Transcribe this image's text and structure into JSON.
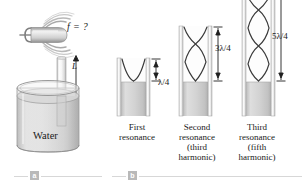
{
  "figure": {
    "panel_a": {
      "marker": "a",
      "frequency_label": "f = ?",
      "length_label": "L",
      "liquid_label": "Water",
      "fork_icon": "tuning-fork-icon",
      "sound_waves_icon": "sound-wave-arcs-icon"
    },
    "panel_b": {
      "marker": "b",
      "tubes": [
        {
          "wavelength_label": "λ/4",
          "caption_lines": [
            "First",
            "resonance"
          ],
          "harmonic": 1,
          "nodes": 1
        },
        {
          "wavelength_label": "3λ/4",
          "caption_lines": [
            "Second",
            "resonance",
            "(third",
            "harmonic)"
          ],
          "harmonic": 3,
          "nodes": 2
        },
        {
          "wavelength_label": "5λ/4",
          "caption_lines": [
            "Third",
            "resonance",
            "(fifth",
            "harmonic)"
          ],
          "harmonic": 5,
          "nodes": 3
        }
      ]
    }
  },
  "colors": {
    "background": "#ffffff",
    "ink": "#1a1a1a",
    "glass_light": "#f2f2f2",
    "glass_mid": "#d9d9d9",
    "glass_dark": "#b5b5b5",
    "water_light": "#e3e3e3",
    "water_mid": "#cfcfcf",
    "water_dark": "#bdbdbd",
    "wave_stroke": "#3a3a3a",
    "marker_box": "#b9b9b9",
    "rule": "#d7d7d7"
  }
}
